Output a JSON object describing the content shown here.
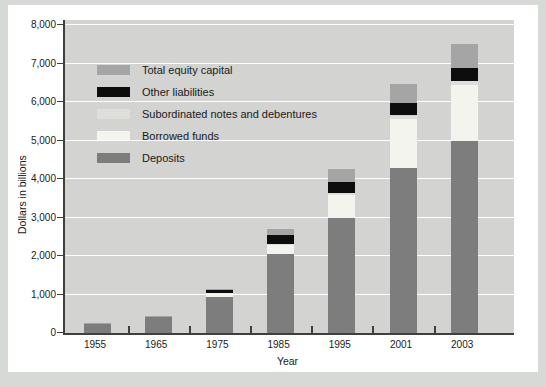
{
  "figure": {
    "xlabel": "Year",
    "ylabel": "Dollars in billions"
  },
  "colors": {
    "page_bg": "#d6d9d6",
    "card_bg": "#ffffff",
    "plot_bg": "#d3d3d1",
    "gridline": "#ffffff",
    "axis": "#3f3f3f",
    "text": "#1a1a1a"
  },
  "chart_data": {
    "type": "bar",
    "stacked": true,
    "title": "",
    "xlabel": "Year",
    "ylabel": "Dollars in billions",
    "categories": [
      "1955",
      "1965",
      "1975",
      "1985",
      "1995",
      "2001",
      "2003"
    ],
    "series": [
      {
        "name": "Deposits",
        "color": "#7d7d7d",
        "values": [
          250,
          410,
          930,
          2040,
          2990,
          4280,
          5000
        ]
      },
      {
        "name": "Borrowed funds",
        "color": "#f4f4ef",
        "values": [
          0,
          0,
          100,
          260,
          600,
          1280,
          1450
        ]
      },
      {
        "name": "Subordinated notes and debentures",
        "color": "#dededa",
        "values": [
          0,
          0,
          0,
          20,
          40,
          90,
          100
        ]
      },
      {
        "name": "Other liabilities",
        "color": "#0d0d0d",
        "values": [
          0,
          0,
          80,
          230,
          280,
          330,
          330
        ]
      },
      {
        "name": "Total equity capital",
        "color": "#a5a5a5",
        "values": [
          10,
          20,
          30,
          150,
          360,
          490,
          640
        ]
      }
    ],
    "totals": [
      260,
      430,
      1140,
      2700,
      4270,
      6470,
      7520
    ],
    "ylim": [
      0,
      8000
    ],
    "ytick_interval": 1000,
    "ytick_labels": [
      "0",
      "1,000",
      "2,000",
      "3,000",
      "4,000",
      "5,000",
      "6,000",
      "7,000",
      "8,000"
    ],
    "legend_position": "upper-left",
    "legend_order_top_to_bottom": [
      "Total equity capital",
      "Other liabilities",
      "Subordinated notes and debentures",
      "Borrowed funds",
      "Deposits"
    ],
    "grid": "horizontal-white"
  }
}
